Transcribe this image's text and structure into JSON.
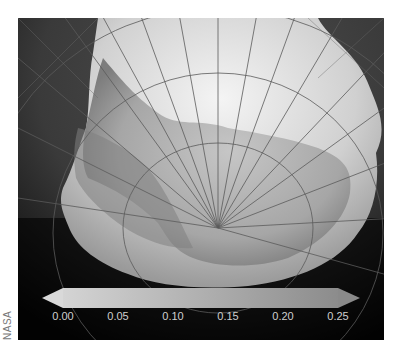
{
  "map": {
    "subject": "Antarctica sea ice (polar stereographic projection)",
    "style": "grayscale",
    "colors": {
      "ocean_open": "#4a4a4a",
      "ocean_far": "#111111",
      "sea_ice": "#e8e8e8",
      "continent": "#a9a9a9",
      "graticule": "#555555"
    }
  },
  "colorbar": {
    "ticks": [
      "0.00",
      "0.05",
      "0.10",
      "0.15",
      "0.20",
      "0.25"
    ],
    "min": 0.0,
    "max": 0.25,
    "extend": "both",
    "gradient_from": "#d4d4d4",
    "gradient_to": "#8c8c8c"
  },
  "credit": "NASA"
}
